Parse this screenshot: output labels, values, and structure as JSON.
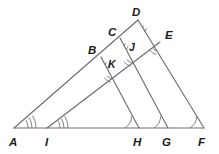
{
  "figure": {
    "kind": "geometry-diagram",
    "stroke_color": "#6e6e6e",
    "label_color": "#1a1a1a",
    "background_color": "#ffffff",
    "labels": {
      "A": "A",
      "I": "I",
      "H": "H",
      "G": "G",
      "F": "F",
      "B": "B",
      "C": "C",
      "D": "D",
      "E": "E",
      "J": "J",
      "K": "K"
    },
    "points": {
      "A": {
        "x": 14,
        "y": 128
      },
      "I": {
        "x": 47,
        "y": 128
      },
      "H": {
        "x": 139,
        "y": 128
      },
      "G": {
        "x": 168,
        "y": 128
      },
      "F": {
        "x": 204,
        "y": 128
      },
      "B": {
        "x": 101,
        "y": 57
      },
      "C": {
        "x": 120,
        "y": 38
      },
      "D": {
        "x": 138,
        "y": 20
      },
      "E": {
        "x": 160,
        "y": 42
      },
      "J": {
        "x": 134,
        "y": 54
      },
      "K": {
        "x": 114,
        "y": 70
      }
    },
    "label_offsets": {
      "A": {
        "x": 9,
        "y": 144
      },
      "I": {
        "x": 44,
        "y": 144
      },
      "H": {
        "x": 134,
        "y": 144
      },
      "G": {
        "x": 163,
        "y": 144
      },
      "F": {
        "x": 199,
        "y": 144
      },
      "B": {
        "x": 90,
        "y": 51
      },
      "C": {
        "x": 110,
        "y": 33
      },
      "D": {
        "x": 133,
        "y": 14
      },
      "E": {
        "x": 166,
        "y": 37
      },
      "J": {
        "x": 131,
        "y": 49
      },
      "K": {
        "x": 110,
        "y": 66
      }
    },
    "segments": [
      {
        "name": "baseline-A-F",
        "from": "A",
        "to": "F"
      },
      {
        "name": "ray-A-D",
        "from": "A",
        "to": "D"
      },
      {
        "name": "ray-I-E",
        "from": "I",
        "to": "E"
      },
      {
        "name": "ray-D-F",
        "from": "D",
        "to": "F"
      },
      {
        "name": "ray-C-G",
        "from": "C",
        "to": "G"
      },
      {
        "name": "ray-B-H",
        "from": "B",
        "to": "H"
      },
      {
        "name": "ray-E-G-lower",
        "from": "E",
        "to": "G"
      }
    ],
    "angle_marks": [
      {
        "name": "angle-at-A",
        "vertex": "A",
        "ticks": 3
      },
      {
        "name": "angle-at-I",
        "vertex": "I",
        "ticks": 3
      },
      {
        "name": "angle-at-H",
        "vertex": "H",
        "ticks": 1
      },
      {
        "name": "angle-at-G",
        "vertex": "G",
        "ticks": 1
      },
      {
        "name": "angle-at-F",
        "vertex": "F",
        "ticks": 1
      },
      {
        "name": "angle-at-B",
        "vertex": "B",
        "ticks": 2
      },
      {
        "name": "angle-at-C",
        "vertex": "C",
        "ticks": 2
      },
      {
        "name": "angle-at-D",
        "vertex": "D",
        "ticks": 2
      },
      {
        "name": "angle-at-E",
        "vertex": "E",
        "ticks": 2
      },
      {
        "name": "angle-at-J",
        "vertex": "J",
        "ticks": 2
      },
      {
        "name": "angle-at-K",
        "vertex": "K",
        "ticks": 2
      }
    ]
  }
}
